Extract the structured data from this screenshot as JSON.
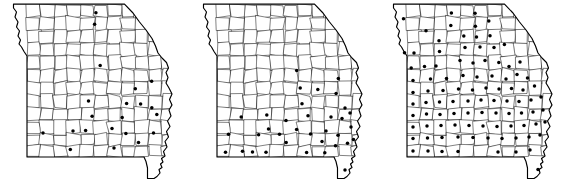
{
  "figure": {
    "panel_count": 3,
    "background_color": "#ffffff",
    "line_color": "#1a1a1a",
    "dot_color": "#000000",
    "caption": "",
    "state": "Missouri",
    "marker_meaning": "county marked present"
  },
  "chart_data": {
    "type": "map",
    "xlabel": "",
    "ylabel": "",
    "projection": "planar outline of Missouri with county subdivisions",
    "marker": "filled black circle centered on county",
    "panels": [
      {
        "index": 1,
        "label": "",
        "dot_count": 21,
        "description": "Dots concentrated in the eastern and southeastern counties, two isolated dots along the far north-central border and two isolated dots in the southwest.",
        "dots": [
          {
            "x": 95.9,
            "y": 12.7
          },
          {
            "x": 94.6,
            "y": 24.2
          },
          {
            "x": 100.2,
            "y": 65.6
          },
          {
            "x": 151.6,
            "y": 81.3
          },
          {
            "x": 135.3,
            "y": 88.8
          },
          {
            "x": 88.5,
            "y": 101.0
          },
          {
            "x": 126.6,
            "y": 103.5
          },
          {
            "x": 140.6,
            "y": 104.1
          },
          {
            "x": 151.8,
            "y": 107.8
          },
          {
            "x": 92.1,
            "y": 116.2
          },
          {
            "x": 122.2,
            "y": 117.5
          },
          {
            "x": 156.8,
            "y": 114.4
          },
          {
            "x": 43.0,
            "y": 132.9
          },
          {
            "x": 73.0,
            "y": 131.0
          },
          {
            "x": 85.6,
            "y": 130.6
          },
          {
            "x": 112.0,
            "y": 128.4
          },
          {
            "x": 125.9,
            "y": 133.4
          },
          {
            "x": 153.5,
            "y": 133.1
          },
          {
            "x": 138.5,
            "y": 142.6
          },
          {
            "x": 114.0,
            "y": 148.0
          },
          {
            "x": 70.3,
            "y": 149.4
          }
        ]
      },
      {
        "index": 2,
        "label": "",
        "dot_count": 35,
        "description": "Dots fill most of the eastern half and push westward across the southern tier; the bootheel now has a dot.",
        "dots": [
          {
            "x": 106.7,
            "y": 70.6
          },
          {
            "x": 148.3,
            "y": 78.4
          },
          {
            "x": 110.2,
            "y": 88.0
          },
          {
            "x": 127.8,
            "y": 89.6
          },
          {
            "x": 146.1,
            "y": 93.5
          },
          {
            "x": 76.8,
            "y": 115.0
          },
          {
            "x": 118.0,
            "y": 115.8
          },
          {
            "x": 155.0,
            "y": 108.0
          },
          {
            "x": 51.2,
            "y": 117.0
          },
          {
            "x": 38.5,
            "y": 134.2
          },
          {
            "x": 78.5,
            "y": 128.9
          },
          {
            "x": 106.6,
            "y": 129.6
          },
          {
            "x": 136.0,
            "y": 131.0
          },
          {
            "x": 148.0,
            "y": 135.3
          },
          {
            "x": 161.0,
            "y": 127.0
          },
          {
            "x": 68.6,
            "y": 134.8
          },
          {
            "x": 120.5,
            "y": 134.0
          },
          {
            "x": 96.2,
            "y": 142.6
          },
          {
            "x": 132.0,
            "y": 141.5
          },
          {
            "x": 145.5,
            "y": 145.8
          },
          {
            "x": 157.5,
            "y": 143.3
          },
          {
            "x": 35.5,
            "y": 152.2
          },
          {
            "x": 52.5,
            "y": 151.3
          },
          {
            "x": 62.5,
            "y": 152.0
          },
          {
            "x": 76.0,
            "y": 152.3
          },
          {
            "x": 116.6,
            "y": 152.4
          },
          {
            "x": 134.8,
            "y": 152.8
          },
          {
            "x": 152.0,
            "y": 118.6
          },
          {
            "x": 112.0,
            "y": 103.8
          },
          {
            "x": 96.0,
            "y": 120.4
          },
          {
            "x": 141.0,
            "y": 117.0
          },
          {
            "x": 160.0,
            "y": 113.0
          },
          {
            "x": 163.5,
            "y": 139.5
          },
          {
            "x": 89.5,
            "y": 134.2
          },
          {
            "x": 155.0,
            "y": 170.0
          }
        ]
      },
      {
        "index": 3,
        "label": "",
        "dot_count": 95,
        "description": "Nearly statewide saturation: dots in almost every county across the north, center, east and south, including the bootheel.",
        "dots": [
          {
            "x": 23.5,
            "y": 18.8
          },
          {
            "x": 46.0,
            "y": 30.8
          },
          {
            "x": 71.4,
            "y": 13.0
          },
          {
            "x": 70.8,
            "y": 25.5
          },
          {
            "x": 95.0,
            "y": 13.3
          },
          {
            "x": 95.4,
            "y": 26.3
          },
          {
            "x": 108.8,
            "y": 21.0
          },
          {
            "x": 83.8,
            "y": 36.0
          },
          {
            "x": 96.5,
            "y": 37.0
          },
          {
            "x": 110.0,
            "y": 35.8
          },
          {
            "x": 24.5,
            "y": 52.8
          },
          {
            "x": 34.0,
            "y": 53.0
          },
          {
            "x": 59.0,
            "y": 40.8
          },
          {
            "x": 59.5,
            "y": 51.5
          },
          {
            "x": 85.0,
            "y": 47.4
          },
          {
            "x": 100.0,
            "y": 47.0
          },
          {
            "x": 114.0,
            "y": 47.5
          },
          {
            "x": 124.4,
            "y": 44.6
          },
          {
            "x": 31.2,
            "y": 68.0
          },
          {
            "x": 44.5,
            "y": 66.5
          },
          {
            "x": 56.0,
            "y": 66.0
          },
          {
            "x": 80.0,
            "y": 60.5
          },
          {
            "x": 93.0,
            "y": 63.0
          },
          {
            "x": 105.0,
            "y": 60.6
          },
          {
            "x": 118.8,
            "y": 62.5
          },
          {
            "x": 129.0,
            "y": 66.5
          },
          {
            "x": 140.0,
            "y": 62.0
          },
          {
            "x": 33.0,
            "y": 80.5
          },
          {
            "x": 50.5,
            "y": 79.0
          },
          {
            "x": 66.5,
            "y": 78.5
          },
          {
            "x": 83.0,
            "y": 75.5
          },
          {
            "x": 97.0,
            "y": 77.0
          },
          {
            "x": 112.0,
            "y": 76.0
          },
          {
            "x": 126.0,
            "y": 79.0
          },
          {
            "x": 137.0,
            "y": 74.5
          },
          {
            "x": 147.5,
            "y": 78.0
          },
          {
            "x": 33.0,
            "y": 92.5
          },
          {
            "x": 48.0,
            "y": 91.0
          },
          {
            "x": 63.0,
            "y": 90.5
          },
          {
            "x": 78.5,
            "y": 89.0
          },
          {
            "x": 92.5,
            "y": 90.0
          },
          {
            "x": 106.0,
            "y": 88.0
          },
          {
            "x": 119.0,
            "y": 89.0
          },
          {
            "x": 131.5,
            "y": 88.5
          },
          {
            "x": 143.0,
            "y": 90.0
          },
          {
            "x": 154.5,
            "y": 86.0
          },
          {
            "x": 33.0,
            "y": 104.0
          },
          {
            "x": 46.0,
            "y": 102.5
          },
          {
            "x": 59.5,
            "y": 102.0
          },
          {
            "x": 73.0,
            "y": 101.5
          },
          {
            "x": 88.0,
            "y": 101.0
          },
          {
            "x": 101.0,
            "y": 100.0
          },
          {
            "x": 114.0,
            "y": 100.5
          },
          {
            "x": 127.0,
            "y": 101.0
          },
          {
            "x": 139.0,
            "y": 101.5
          },
          {
            "x": 151.0,
            "y": 100.0
          },
          {
            "x": 161.0,
            "y": 97.0
          },
          {
            "x": 33.0,
            "y": 115.5
          },
          {
            "x": 46.5,
            "y": 114.0
          },
          {
            "x": 60.0,
            "y": 114.5
          },
          {
            "x": 74.0,
            "y": 113.5
          },
          {
            "x": 88.0,
            "y": 113.0
          },
          {
            "x": 102.0,
            "y": 112.5
          },
          {
            "x": 116.0,
            "y": 113.0
          },
          {
            "x": 129.0,
            "y": 113.5
          },
          {
            "x": 141.5,
            "y": 113.0
          },
          {
            "x": 153.0,
            "y": 112.0
          },
          {
            "x": 163.0,
            "y": 110.0
          },
          {
            "x": 33.0,
            "y": 127.0
          },
          {
            "x": 47.0,
            "y": 126.0
          },
          {
            "x": 61.0,
            "y": 125.5
          },
          {
            "x": 75.0,
            "y": 125.0
          },
          {
            "x": 89.0,
            "y": 125.5
          },
          {
            "x": 103.0,
            "y": 126.0
          },
          {
            "x": 117.0,
            "y": 126.5
          },
          {
            "x": 131.0,
            "y": 126.0
          },
          {
            "x": 144.0,
            "y": 125.5
          },
          {
            "x": 156.0,
            "y": 124.0
          },
          {
            "x": 165.0,
            "y": 122.0
          },
          {
            "x": 33.0,
            "y": 138.5
          },
          {
            "x": 47.5,
            "y": 138.0
          },
          {
            "x": 62.0,
            "y": 137.5
          },
          {
            "x": 78.0,
            "y": 137.0
          },
          {
            "x": 93.0,
            "y": 137.5
          },
          {
            "x": 108.0,
            "y": 138.0
          },
          {
            "x": 122.0,
            "y": 138.5
          },
          {
            "x": 136.0,
            "y": 138.0
          },
          {
            "x": 149.0,
            "y": 137.0
          },
          {
            "x": 160.0,
            "y": 135.0
          },
          {
            "x": 33.0,
            "y": 151.0
          },
          {
            "x": 48.0,
            "y": 151.0
          },
          {
            "x": 62.0,
            "y": 151.5
          },
          {
            "x": 78.0,
            "y": 151.5
          },
          {
            "x": 118.0,
            "y": 152.0
          },
          {
            "x": 136.0,
            "y": 152.0
          },
          {
            "x": 150.0,
            "y": 150.0
          },
          {
            "x": 158.0,
            "y": 169.5
          }
        ]
      }
    ]
  }
}
